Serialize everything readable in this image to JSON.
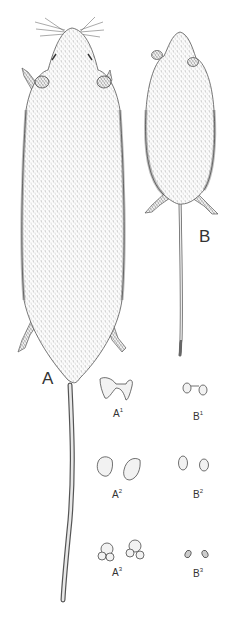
{
  "figure": {
    "type": "scientific-illustration",
    "specimens": [
      {
        "id": "A",
        "label": "A",
        "description": "larger rodent, dorsal view, long tail"
      },
      {
        "id": "B",
        "label": "B",
        "description": "smaller rodent, dorsal view, long thin tail"
      }
    ],
    "tooth_labels": [
      {
        "base": "A",
        "sup": "1"
      },
      {
        "base": "B",
        "sup": "1"
      },
      {
        "base": "A",
        "sup": "2"
      },
      {
        "base": "B",
        "sup": "2"
      },
      {
        "base": "A",
        "sup": "3"
      },
      {
        "base": "B",
        "sup": "3"
      }
    ],
    "colors": {
      "background": "#ffffff",
      "ink": "#2a2a2a"
    }
  }
}
